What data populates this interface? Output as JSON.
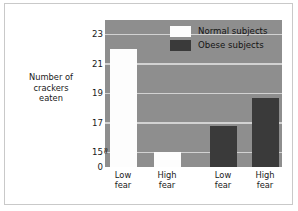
{
  "chart_data": {
    "type": "bar",
    "title": "",
    "xlabel": "",
    "ylabel": "Number of\ncrackers\neaten",
    "categories": [
      "Low\nfear",
      "High\nfear",
      "Low\nfear",
      "High\nfear"
    ],
    "series": [
      {
        "name": "Normal subjects",
        "color": "#fdfdfd",
        "values": [
          22,
          15,
          null,
          null
        ]
      },
      {
        "name": "Obese subjects",
        "color": "#3a3a3a",
        "values": [
          null,
          null,
          16.8,
          18.7
        ]
      }
    ],
    "bars": [
      {
        "label": "Low\nfear",
        "group": "Normal subjects",
        "value": 22,
        "color": "#fdfdfd"
      },
      {
        "label": "High\nfear",
        "group": "Normal subjects",
        "value": 15,
        "color": "#fdfdfd"
      },
      {
        "label": "Low\nfear",
        "group": "Obese subjects",
        "value": 16.8,
        "color": "#3a3a3a"
      },
      {
        "label": "High\nfear",
        "group": "Obese subjects",
        "value": 18.7,
        "color": "#3a3a3a"
      }
    ],
    "ytick_labels": [
      "23",
      "21",
      "19",
      "17",
      "15",
      "0"
    ],
    "ytick_values": [
      23,
      21,
      19,
      17,
      15,
      0
    ],
    "ylim": [
      0,
      24
    ],
    "axis_break": "≈",
    "axis_break_note": "y-axis broken between 0 and 15",
    "grid": true,
    "legend_position": "top-right inside plot",
    "plot_background": "#8e8e8e",
    "gridline_color": "#d2d2d2"
  },
  "legend": {
    "entries": [
      {
        "label": "Normal subjects"
      },
      {
        "label": "Obese subjects"
      }
    ]
  }
}
